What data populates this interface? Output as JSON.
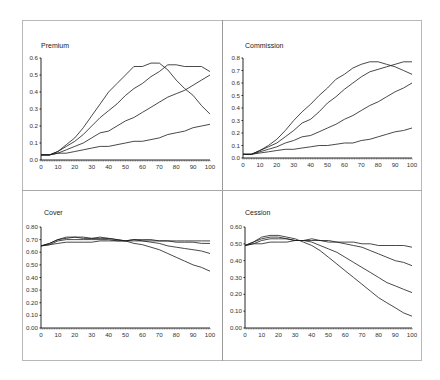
{
  "chart_data": [
    {
      "type": "line",
      "title": "Premium",
      "xlabel": "",
      "ylabel": "",
      "x": [
        0,
        5,
        10,
        15,
        20,
        25,
        30,
        35,
        40,
        45,
        50,
        55,
        60,
        65,
        70,
        75,
        80,
        85,
        90,
        95,
        100
      ],
      "ylim": [
        0,
        0.6
      ],
      "xlim": [
        0,
        100
      ],
      "yticks": [
        "0.0",
        "0.1",
        "0.2",
        "0.3",
        "0.4",
        "0.5",
        "0.6"
      ],
      "xticks": [
        "0",
        "10",
        "20",
        "30",
        "40",
        "50",
        "60",
        "70",
        "80",
        "90",
        "100"
      ],
      "grid": false,
      "series": [
        {
          "name": "Series 1",
          "values": [
            0.03,
            0.03,
            0.05,
            0.09,
            0.13,
            0.19,
            0.26,
            0.33,
            0.4,
            0.45,
            0.5,
            0.55,
            0.55,
            0.57,
            0.57,
            0.53,
            0.47,
            0.42,
            0.38,
            0.32,
            0.27
          ]
        },
        {
          "name": "Series 2",
          "values": [
            0.03,
            0.03,
            0.05,
            0.08,
            0.11,
            0.15,
            0.2,
            0.25,
            0.29,
            0.33,
            0.38,
            0.42,
            0.45,
            0.49,
            0.52,
            0.56,
            0.56,
            0.55,
            0.55,
            0.55,
            0.52
          ]
        },
        {
          "name": "Series 3",
          "values": [
            0.03,
            0.03,
            0.04,
            0.06,
            0.08,
            0.1,
            0.13,
            0.16,
            0.17,
            0.2,
            0.23,
            0.25,
            0.28,
            0.31,
            0.34,
            0.37,
            0.39,
            0.41,
            0.44,
            0.47,
            0.5
          ]
        },
        {
          "name": "Series 4",
          "values": [
            0.03,
            0.03,
            0.04,
            0.04,
            0.05,
            0.06,
            0.07,
            0.08,
            0.08,
            0.09,
            0.1,
            0.11,
            0.11,
            0.12,
            0.13,
            0.15,
            0.16,
            0.17,
            0.19,
            0.2,
            0.21
          ]
        }
      ]
    },
    {
      "type": "line",
      "title": "Commission",
      "xlabel": "",
      "ylabel": "",
      "x": [
        0,
        5,
        10,
        15,
        20,
        25,
        30,
        35,
        40,
        45,
        50,
        55,
        60,
        65,
        70,
        75,
        80,
        85,
        90,
        95,
        100
      ],
      "ylim": [
        0,
        0.8
      ],
      "xlim": [
        0,
        100
      ],
      "yticks": [
        "0.0",
        "0.1",
        "0.2",
        "0.3",
        "0.4",
        "0.5",
        "0.6",
        "0.7",
        "0.8"
      ],
      "xticks": [
        "0",
        "10",
        "20",
        "30",
        "40",
        "50",
        "60",
        "70",
        "80",
        "90",
        "100"
      ],
      "grid": false,
      "series": [
        {
          "name": "Series 1",
          "values": [
            0.03,
            0.03,
            0.06,
            0.1,
            0.15,
            0.22,
            0.3,
            0.37,
            0.43,
            0.5,
            0.56,
            0.63,
            0.67,
            0.72,
            0.75,
            0.77,
            0.77,
            0.75,
            0.73,
            0.7,
            0.67
          ]
        },
        {
          "name": "Series 2",
          "values": [
            0.03,
            0.03,
            0.06,
            0.09,
            0.12,
            0.17,
            0.22,
            0.28,
            0.31,
            0.37,
            0.44,
            0.49,
            0.55,
            0.6,
            0.65,
            0.69,
            0.71,
            0.73,
            0.75,
            0.77,
            0.77
          ]
        },
        {
          "name": "Series 3",
          "values": [
            0.03,
            0.03,
            0.05,
            0.07,
            0.09,
            0.12,
            0.14,
            0.17,
            0.18,
            0.21,
            0.24,
            0.27,
            0.31,
            0.34,
            0.38,
            0.42,
            0.45,
            0.49,
            0.53,
            0.56,
            0.6
          ]
        },
        {
          "name": "Series 4",
          "values": [
            0.03,
            0.03,
            0.04,
            0.05,
            0.06,
            0.07,
            0.07,
            0.08,
            0.09,
            0.1,
            0.1,
            0.11,
            0.12,
            0.12,
            0.14,
            0.15,
            0.17,
            0.19,
            0.21,
            0.22,
            0.24
          ]
        }
      ]
    },
    {
      "type": "line",
      "title": "Cover",
      "xlabel": "",
      "ylabel": "",
      "x": [
        0,
        5,
        10,
        15,
        20,
        25,
        30,
        35,
        40,
        45,
        50,
        55,
        60,
        65,
        70,
        75,
        80,
        85,
        90,
        95,
        100
      ],
      "ylim": [
        0,
        0.8
      ],
      "xlim": [
        0,
        100
      ],
      "yticks": [
        "0.00",
        "0.10",
        "0.20",
        "0.30",
        "0.40",
        "0.50",
        "0.60",
        "0.70",
        "0.80"
      ],
      "xticks": [
        "0",
        "10",
        "20",
        "30",
        "40",
        "50",
        "60",
        "70",
        "80",
        "90",
        "100"
      ],
      "grid": false,
      "series": [
        {
          "name": "Series 1",
          "values": [
            0.65,
            0.67,
            0.7,
            0.72,
            0.72,
            0.72,
            0.71,
            0.72,
            0.71,
            0.7,
            0.69,
            0.67,
            0.66,
            0.64,
            0.62,
            0.59,
            0.56,
            0.53,
            0.5,
            0.48,
            0.45
          ]
        },
        {
          "name": "Series 2",
          "values": [
            0.65,
            0.67,
            0.7,
            0.71,
            0.72,
            0.71,
            0.71,
            0.71,
            0.71,
            0.7,
            0.69,
            0.69,
            0.69,
            0.68,
            0.67,
            0.65,
            0.64,
            0.63,
            0.62,
            0.61,
            0.59
          ]
        },
        {
          "name": "Series 3",
          "values": [
            0.65,
            0.66,
            0.69,
            0.7,
            0.7,
            0.7,
            0.7,
            0.7,
            0.7,
            0.69,
            0.69,
            0.7,
            0.69,
            0.69,
            0.69,
            0.69,
            0.68,
            0.68,
            0.68,
            0.67,
            0.67
          ]
        },
        {
          "name": "Series 4",
          "values": [
            0.65,
            0.66,
            0.67,
            0.68,
            0.68,
            0.68,
            0.68,
            0.69,
            0.69,
            0.69,
            0.69,
            0.7,
            0.7,
            0.7,
            0.69,
            0.69,
            0.69,
            0.69,
            0.69,
            0.69,
            0.69
          ]
        }
      ]
    },
    {
      "type": "line",
      "title": "Cession",
      "xlabel": "",
      "ylabel": "",
      "x": [
        0,
        5,
        10,
        15,
        20,
        25,
        30,
        35,
        40,
        45,
        50,
        55,
        60,
        65,
        70,
        75,
        80,
        85,
        90,
        95,
        100
      ],
      "ylim": [
        0,
        0.6
      ],
      "xlim": [
        0,
        100
      ],
      "yticks": [
        "0.00",
        "0.10",
        "0.20",
        "0.30",
        "0.40",
        "0.50",
        "0.60"
      ],
      "xticks": [
        "0",
        "10",
        "20",
        "30",
        "40",
        "50",
        "60",
        "70",
        "80",
        "90",
        "100"
      ],
      "grid": false,
      "series": [
        {
          "name": "Series 1",
          "values": [
            0.49,
            0.51,
            0.54,
            0.55,
            0.55,
            0.54,
            0.53,
            0.51,
            0.49,
            0.46,
            0.42,
            0.38,
            0.34,
            0.3,
            0.26,
            0.22,
            0.18,
            0.15,
            0.12,
            0.09,
            0.07
          ]
        },
        {
          "name": "Series 2",
          "values": [
            0.49,
            0.51,
            0.53,
            0.54,
            0.54,
            0.53,
            0.52,
            0.52,
            0.51,
            0.49,
            0.47,
            0.45,
            0.42,
            0.39,
            0.36,
            0.33,
            0.3,
            0.27,
            0.25,
            0.23,
            0.21
          ]
        },
        {
          "name": "Series 3",
          "values": [
            0.49,
            0.5,
            0.52,
            0.53,
            0.53,
            0.53,
            0.52,
            0.52,
            0.53,
            0.52,
            0.51,
            0.51,
            0.5,
            0.49,
            0.48,
            0.46,
            0.44,
            0.42,
            0.4,
            0.39,
            0.37
          ]
        },
        {
          "name": "Series 4",
          "values": [
            0.49,
            0.5,
            0.5,
            0.51,
            0.51,
            0.51,
            0.52,
            0.52,
            0.52,
            0.52,
            0.52,
            0.51,
            0.51,
            0.51,
            0.5,
            0.5,
            0.49,
            0.49,
            0.49,
            0.49,
            0.48
          ]
        }
      ]
    }
  ],
  "panels": [
    {
      "title": "Premium",
      "left": 41,
      "right": 210,
      "top": 58,
      "bottom": 160
    },
    {
      "title": "Commission",
      "left": 243,
      "right": 412,
      "top": 58,
      "bottom": 158
    },
    {
      "title": "Cover",
      "left": 41,
      "right": 210,
      "top": 227,
      "bottom": 328
    },
    {
      "title": "Cession",
      "left": 245,
      "right": 412,
      "top": 227,
      "bottom": 328
    }
  ]
}
